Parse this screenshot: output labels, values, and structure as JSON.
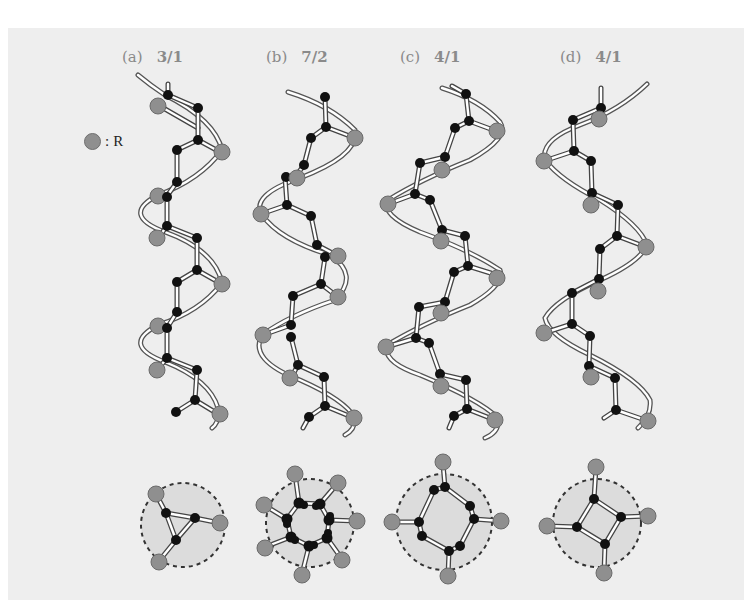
{
  "figure": {
    "background": "#eeeeee",
    "colors": {
      "R_atom": "#8f8f8f",
      "backbone_atom": "#111111",
      "bond": "#ffffff",
      "bond_outline": "#555555",
      "helix_ribbon": "#ffffff",
      "projection_fill": "#dcdcdc",
      "projection_border": "#333333"
    },
    "legend": {
      "symbol": "gray-circle",
      "separator": ":",
      "label": "R"
    },
    "panels": [
      {
        "id": "a",
        "letter": "(a)",
        "helix_ratio": "3/1",
        "x": 178
      },
      {
        "id": "b",
        "letter": "(b)",
        "helix_ratio": "7/2",
        "x": 300
      },
      {
        "id": "c",
        "letter": "(c)",
        "helix_ratio": "4/1",
        "x": 440
      },
      {
        "id": "d",
        "letter": "(d)",
        "helix_ratio": "4/1",
        "x": 595
      }
    ],
    "projections": [
      {
        "id": "a",
        "ring_atoms": 3,
        "R_groups": 3,
        "cx": 178,
        "cy": 525
      },
      {
        "id": "b",
        "ring_atoms": 7,
        "R_groups": 7,
        "cx": 305,
        "cy": 524
      },
      {
        "id": "c",
        "ring_atoms": 8,
        "R_groups": 4,
        "cx": 440,
        "cy": 524
      },
      {
        "id": "d",
        "ring_atoms": 4,
        "R_groups": 4,
        "cx": 595,
        "cy": 524
      }
    ]
  }
}
